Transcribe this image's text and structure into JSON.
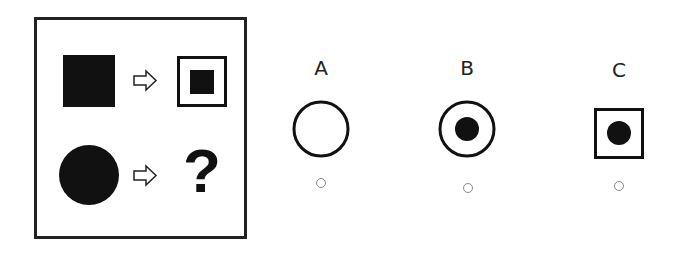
{
  "puzzle": {
    "row1": {
      "input": "filled-square",
      "output": "filled-square-inside-square-outline"
    },
    "row2": {
      "input": "filled-circle",
      "output_placeholder": "?"
    }
  },
  "options": [
    {
      "label": "A",
      "shape": "empty-circle"
    },
    {
      "label": "B",
      "shape": "filled-circle-inside-circle-outline"
    },
    {
      "label": "C",
      "shape": "filled-circle-inside-square-outline"
    }
  ],
  "colors": {
    "ink": "#111111",
    "radio_border": "#888888",
    "background": "#ffffff"
  }
}
